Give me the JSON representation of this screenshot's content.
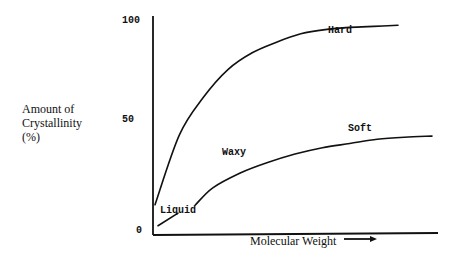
{
  "chart_data": {
    "type": "line",
    "title": "",
    "ylabel_lines": [
      "Amount of",
      "Crystallinity",
      "(%)"
    ],
    "xlabel": "Molecular Weight",
    "xlabel_arrow": "right-arrow",
    "yticks": [
      "100",
      "50",
      "0"
    ],
    "ylim": [
      0,
      100
    ],
    "series": [
      {
        "name": "upper",
        "x": [
          0,
          0.1,
          0.2,
          0.3,
          0.4,
          0.5,
          0.6,
          0.7,
          0.8,
          0.9,
          1.0
        ],
        "values": [
          12,
          45,
          63,
          76,
          84,
          89,
          93,
          95,
          96,
          96.5,
          97
        ]
      },
      {
        "name": "lower",
        "x": [
          0,
          0.1,
          0.2,
          0.3,
          0.4,
          0.5,
          0.6,
          0.7,
          0.8,
          0.9,
          1.0
        ],
        "values": [
          2,
          10,
          20,
          27,
          32,
          36,
          39,
          41,
          43,
          44,
          44.5
        ]
      }
    ],
    "annotations": [
      {
        "text": "Hard",
        "near": "upper curve end"
      },
      {
        "text": "Soft",
        "near": "lower curve end"
      },
      {
        "text": "Waxy",
        "near": "between curves"
      },
      {
        "text": "Liquid",
        "near": "origin"
      }
    ]
  }
}
